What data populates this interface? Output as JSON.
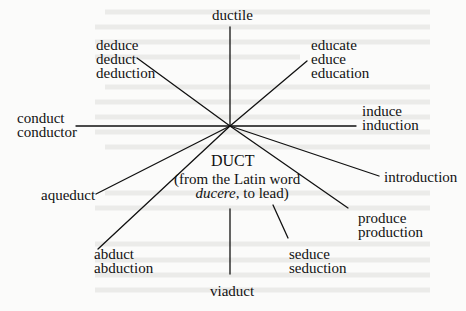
{
  "diagram": {
    "root": "DUCT",
    "root_note_line1": "(from the Latin word",
    "root_note_word": "ducere",
    "root_note_rest": ", to lead)",
    "branches": {
      "top": [
        "ductile"
      ],
      "upper_left": [
        "deduce",
        "deduct",
        "deduction"
      ],
      "upper_right": [
        "educate",
        "educe",
        "education"
      ],
      "left": [
        "conduct",
        "conductor"
      ],
      "right": [
        "induce",
        "induction"
      ],
      "lower_right_1": [
        "introduction"
      ],
      "lower_right_2": [
        "produce",
        "production"
      ],
      "lower_right_3": [
        "seduce",
        "seduction"
      ],
      "bottom": [
        "viaduct"
      ],
      "lower_left_1": [
        "aqueduct"
      ],
      "lower_left_2": [
        "abduct",
        "abduction"
      ]
    }
  },
  "colors": {
    "ink": "#111111",
    "paper": "#fbfbfa",
    "bleed": "#e6e6e4"
  }
}
